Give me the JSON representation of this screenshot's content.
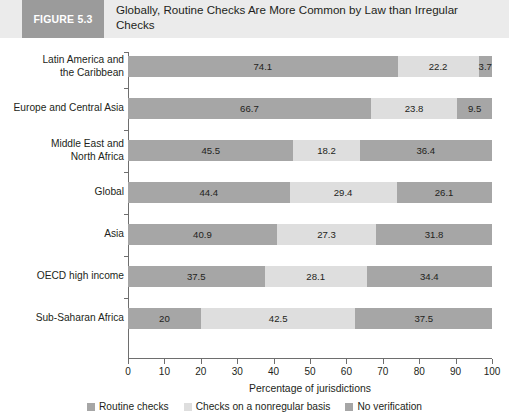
{
  "header": {
    "figure_tag": "FIGURE 5.3",
    "title": "Globally, Routine Checks Are More Common by Law than Irregular Checks",
    "band_color": "#ebebeb",
    "tag_color": "#9b9b9b"
  },
  "chart_data": {
    "type": "bar",
    "orientation": "horizontal",
    "stacked": true,
    "title": "Globally, Routine Checks Are More Common by Law than Irregular Checks",
    "xlabel": "Percentage of jurisdictions",
    "ylabel": "",
    "xlim": [
      0,
      100
    ],
    "xticks": [
      0,
      10,
      20,
      30,
      40,
      50,
      60,
      70,
      80,
      90,
      100
    ],
    "grid": false,
    "legend_position": "bottom",
    "categories": [
      "Latin America and the Caribbean",
      "Europe and Central Asia",
      "Middle East and North Africa",
      "Global",
      "Asia",
      "OECD high income",
      "Sub-Saharan Africa"
    ],
    "category_lines": [
      [
        "Latin America and",
        "the Caribbean"
      ],
      [
        "Europe and Central Asia"
      ],
      [
        "Middle East and",
        "North Africa"
      ],
      [
        "Global"
      ],
      [
        "Asia"
      ],
      [
        "OECD high income"
      ],
      [
        "Sub-Saharan Africa"
      ]
    ],
    "series": [
      {
        "name": "Routine checks",
        "color": "#a6a6a6",
        "values": [
          74.1,
          66.7,
          45.5,
          44.4,
          40.9,
          37.5,
          20
        ]
      },
      {
        "name": "Checks on a nonregular basis",
        "color": "#dedede",
        "values": [
          22.2,
          23.8,
          18.2,
          29.4,
          27.3,
          28.1,
          42.5
        ]
      },
      {
        "name": "No verification",
        "color": "#a6a6a6",
        "values": [
          3.7,
          9.5,
          36.4,
          26.1,
          31.8,
          34.4,
          37.5
        ]
      }
    ]
  }
}
